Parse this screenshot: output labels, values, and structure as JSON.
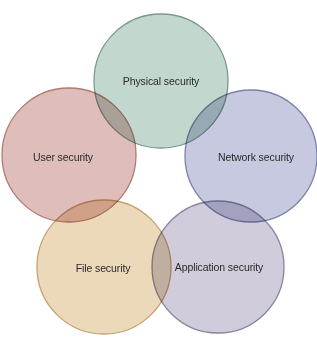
{
  "diagram": {
    "type": "venn-ring",
    "nodes": [
      {
        "id": "physical",
        "label": "Physical security",
        "cx": 161,
        "cy": 81,
        "r": 67,
        "fill": "#b7d1c6",
        "stroke": "#7c988c",
        "label_x": 161,
        "label_y": 81
      },
      {
        "id": "user",
        "label": "User security",
        "cx": 69,
        "cy": 155,
        "r": 67,
        "fill": "#d9b2af",
        "stroke": "#b27a70",
        "label_x": 63,
        "label_y": 157
      },
      {
        "id": "network",
        "label": "Network security",
        "cx": 251,
        "cy": 156,
        "r": 66,
        "fill": "#bcbfd9",
        "stroke": "#7d82a6",
        "label_x": 256,
        "label_y": 157
      },
      {
        "id": "file",
        "label": "File security",
        "cx": 104,
        "cy": 267,
        "r": 67,
        "fill": "#e8d2ad",
        "stroke": "#c4a170",
        "label_x": 103,
        "label_y": 268
      },
      {
        "id": "application",
        "label": "Application security",
        "cx": 218,
        "cy": 267,
        "r": 66,
        "fill": "#c8c3d6",
        "stroke": "#8a849c",
        "label_x": 219,
        "label_y": 267
      }
    ]
  }
}
